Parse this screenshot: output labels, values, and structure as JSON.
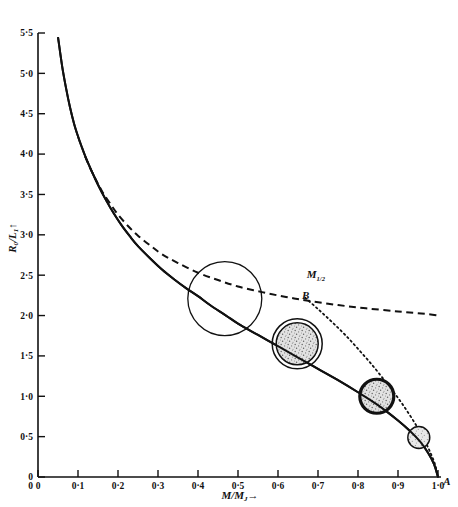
{
  "chart_data": {
    "type": "line",
    "title": "",
    "subtitle": "",
    "xlabel": "M/M",
    "xlabel_sub": "J",
    "xlabel_arrow": "→",
    "ylabel": "R",
    "ylabel_sub": "0",
    "ylabel_denom": "L",
    "ylabel_denom_sub": "1",
    "ylabel_arrow": "↑",
    "xlim": [
      0,
      1.0
    ],
    "ylim": [
      0,
      5.5
    ],
    "grid": false,
    "legend_position": "none",
    "x_ticks": [
      "0",
      "0·1",
      "0·2",
      "0·3",
      "0·4",
      "0·5",
      "0·6",
      "0·7",
      "0·8",
      "0·9",
      "1·0"
    ],
    "x_tick_values": [
      0,
      0.1,
      0.2,
      0.3,
      0.4,
      0.5,
      0.6,
      0.7,
      0.8,
      0.9,
      1.0
    ],
    "y_ticks": [
      "0",
      "0·5",
      "1·0",
      "1·5",
      "2·0",
      "2·5",
      "3·0",
      "3·5",
      "4·0",
      "4·5",
      "5·0",
      "5·5"
    ],
    "y_tick_values": [
      0,
      0.5,
      1.0,
      1.5,
      2.0,
      2.5,
      3.0,
      3.5,
      4.0,
      4.5,
      5.0,
      5.5
    ],
    "y_origin_label": "0",
    "series": [
      {
        "name": "main-solid-curve",
        "style": "solid",
        "points": [
          [
            0.05,
            5.45
          ],
          [
            0.06,
            5.1
          ],
          [
            0.07,
            4.82
          ],
          [
            0.08,
            4.58
          ],
          [
            0.09,
            4.38
          ],
          [
            0.1,
            4.22
          ],
          [
            0.11,
            4.08
          ],
          [
            0.12,
            3.95
          ],
          [
            0.135,
            3.78
          ],
          [
            0.15,
            3.62
          ],
          [
            0.17,
            3.43
          ],
          [
            0.19,
            3.26
          ],
          [
            0.21,
            3.11
          ],
          [
            0.23,
            2.98
          ],
          [
            0.25,
            2.86
          ],
          [
            0.28,
            2.71
          ],
          [
            0.31,
            2.57
          ],
          [
            0.34,
            2.45
          ],
          [
            0.37,
            2.34
          ],
          [
            0.4,
            2.24
          ],
          [
            0.43,
            2.13
          ],
          [
            0.47,
            2.0
          ],
          [
            0.5,
            1.9
          ],
          [
            0.55,
            1.76
          ],
          [
            0.6,
            1.62
          ],
          [
            0.65,
            1.48
          ],
          [
            0.7,
            1.34
          ],
          [
            0.75,
            1.2
          ],
          [
            0.8,
            1.05
          ],
          [
            0.85,
            0.89
          ],
          [
            0.9,
            0.7
          ],
          [
            0.93,
            0.57
          ],
          [
            0.955,
            0.44
          ],
          [
            0.975,
            0.3
          ],
          [
            0.99,
            0.16
          ],
          [
            1.0,
            0.0
          ]
        ]
      },
      {
        "name": "dashed-branch-curve",
        "style": "dashed",
        "points": [
          [
            0.118,
            3.97
          ],
          [
            0.13,
            3.83
          ],
          [
            0.145,
            3.68
          ],
          [
            0.16,
            3.54
          ],
          [
            0.18,
            3.39
          ],
          [
            0.2,
            3.25
          ],
          [
            0.225,
            3.11
          ],
          [
            0.25,
            2.99
          ],
          [
            0.28,
            2.87
          ],
          [
            0.31,
            2.76
          ],
          [
            0.35,
            2.65
          ],
          [
            0.4,
            2.53
          ],
          [
            0.45,
            2.44
          ],
          [
            0.5,
            2.36
          ],
          [
            0.56,
            2.29
          ],
          [
            0.62,
            2.23
          ],
          [
            0.68,
            2.18
          ],
          [
            0.75,
            2.13
          ],
          [
            0.82,
            2.09
          ],
          [
            0.9,
            2.05
          ],
          [
            0.97,
            2.02
          ],
          [
            1.0,
            2.0
          ]
        ]
      },
      {
        "name": "dotted-curve",
        "style": "dotted",
        "points": [
          [
            0.668,
            2.22
          ],
          [
            0.7,
            2.08
          ],
          [
            0.735,
            1.92
          ],
          [
            0.77,
            1.75
          ],
          [
            0.805,
            1.56
          ],
          [
            0.84,
            1.36
          ],
          [
            0.872,
            1.16
          ],
          [
            0.9,
            0.98
          ],
          [
            0.925,
            0.8
          ],
          [
            0.948,
            0.62
          ],
          [
            0.967,
            0.45
          ],
          [
            0.982,
            0.29
          ],
          [
            0.993,
            0.15
          ],
          [
            1.0,
            0.0
          ]
        ]
      }
    ],
    "markers": [
      {
        "name": "circle-large-open",
        "x": 0.467,
        "y": 2.21,
        "radius_px": 37,
        "fill": "none",
        "ring": "single",
        "stroke_width": 1.3
      },
      {
        "name": "circle-stippled-double-ring",
        "x": 0.648,
        "y": 1.65,
        "radius_px": 25,
        "fill": "stipple",
        "ring": "double",
        "stroke_width": 1.5
      },
      {
        "name": "circle-stippled-thick-ring",
        "x": 0.847,
        "y": 1.0,
        "radius_px": 17,
        "fill": "stipple",
        "ring": "thick",
        "stroke_width": 3.2
      },
      {
        "name": "circle-small",
        "x": 0.952,
        "y": 0.49,
        "radius_px": 11,
        "fill": "stipple-light",
        "ring": "single",
        "stroke_width": 1.4
      }
    ],
    "annotations": [
      {
        "name": "annotation-m-half",
        "text": "M",
        "sub": "1/2",
        "x": 0.672,
        "y": 2.46
      },
      {
        "name": "annotation-point-b",
        "text": "B",
        "sub": "",
        "x": 0.66,
        "y": 2.21
      },
      {
        "name": "annotation-point-a",
        "text": "A",
        "sub": "",
        "x": 1.013,
        "y": -0.1
      }
    ],
    "colors": {
      "curve": "#111111",
      "axis": "#111111",
      "text": "#111111",
      "stipple": "#d8d8d8",
      "background": "#ffffff"
    }
  }
}
